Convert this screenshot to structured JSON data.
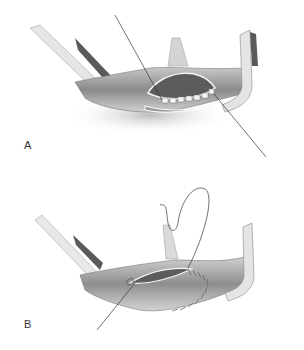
{
  "figure": {
    "panels": [
      {
        "id": "A",
        "label": "A",
        "description": "Vessel with arteriotomy retracted by clamps; interrupted sutures placed along lower edge, suture ends extending diagonally"
      },
      {
        "id": "B",
        "label": "B",
        "description": "Vessel with partially closed arteriotomy; running suture with needle loop above, suture tail extending to lower left"
      }
    ],
    "colors": {
      "background": "#ffffff",
      "line": "#333333",
      "shade_dark": "#6a6a6a",
      "shade_mid": "#a8a8a8",
      "shade_light": "#d9d9d9"
    }
  }
}
